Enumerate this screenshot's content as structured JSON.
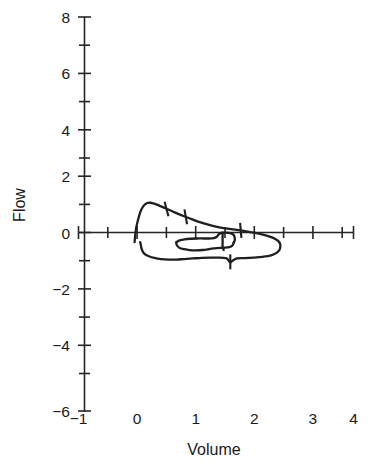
{
  "chart_data": {
    "type": "line",
    "title": "",
    "subtitle": "",
    "xlabel": "Volume",
    "ylabel": "Flow",
    "xlim": [
      -1,
      4
    ],
    "ylim": [
      -6,
      8
    ],
    "grid": false,
    "legend": null,
    "x_ticks_major": [
      -1,
      0,
      1,
      2,
      3,
      4
    ],
    "x_ticks_major_labels": [
      "−1",
      "0",
      "1",
      "2",
      "3",
      "4"
    ],
    "x_ticks_minor": [
      -0.5,
      0.5,
      1.5,
      2.5,
      3.5
    ],
    "y_ticks_major": [
      8,
      6,
      4,
      2,
      0,
      -2,
      -4,
      -6
    ],
    "y_ticks_major_labels": [
      "8",
      "6",
      "4",
      "2",
      "0",
      "−2",
      "−4",
      "−6"
    ],
    "y_ticks_minor": [
      7,
      5,
      3,
      1,
      -1,
      -3,
      -5
    ],
    "series": [
      {
        "name": "expiratory-limb",
        "comment": "rising limb from volume 0 to peak flow then falling to end of expiration",
        "points": [
          [
            0.02,
            0.0
          ],
          [
            0.03,
            0.22
          ],
          [
            0.05,
            0.52
          ],
          [
            0.09,
            0.85
          ],
          [
            0.13,
            1.1
          ],
          [
            0.18,
            1.28
          ],
          [
            0.24,
            1.38
          ],
          [
            0.31,
            1.4
          ],
          [
            0.4,
            1.35
          ],
          [
            0.5,
            1.27
          ],
          [
            0.62,
            1.17
          ],
          [
            0.76,
            1.05
          ],
          [
            0.92,
            0.92
          ],
          [
            1.08,
            0.8
          ],
          [
            1.22,
            0.7
          ],
          [
            1.36,
            0.62
          ],
          [
            1.5,
            0.55
          ],
          [
            1.64,
            0.5
          ],
          [
            1.78,
            0.46
          ],
          [
            1.95,
            0.42
          ],
          [
            2.12,
            0.36
          ],
          [
            2.28,
            0.3
          ],
          [
            2.42,
            0.23
          ],
          [
            2.54,
            0.15
          ],
          [
            2.62,
            0.06
          ],
          [
            2.65,
            0.0
          ]
        ]
      },
      {
        "name": "inspiratory-limb",
        "comment": "returns from end-expiration back to volume 0 below the zero-flow axis",
        "points": [
          [
            2.65,
            0.0
          ],
          [
            2.67,
            -0.1
          ],
          [
            2.66,
            -0.25
          ],
          [
            2.6,
            -0.38
          ],
          [
            2.5,
            -0.47
          ],
          [
            2.35,
            -0.52
          ],
          [
            2.18,
            -0.55
          ],
          [
            2.02,
            -0.57
          ],
          [
            1.88,
            -0.58
          ],
          [
            1.8,
            -0.66
          ],
          [
            1.76,
            -0.72
          ],
          [
            1.72,
            -0.63
          ],
          [
            1.68,
            -0.57
          ],
          [
            1.55,
            -0.55
          ],
          [
            1.4,
            -0.55
          ],
          [
            1.24,
            -0.56
          ],
          [
            1.08,
            -0.58
          ],
          [
            0.92,
            -0.6
          ],
          [
            0.78,
            -0.62
          ],
          [
            0.64,
            -0.62
          ],
          [
            0.5,
            -0.6
          ],
          [
            0.38,
            -0.56
          ],
          [
            0.28,
            -0.5
          ],
          [
            0.2,
            -0.42
          ],
          [
            0.16,
            -0.3
          ],
          [
            0.14,
            -0.18
          ],
          [
            0.13,
            -0.06
          ],
          [
            0.12,
            0.0
          ]
        ]
      },
      {
        "name": "tidal-loop-upper",
        "comment": "small inner tidal breathing loop, upper (expiratory) portion",
        "points": [
          [
            0.78,
            0.0
          ],
          [
            0.84,
            0.06
          ],
          [
            0.93,
            0.1
          ],
          [
            1.04,
            0.12
          ],
          [
            1.16,
            0.13
          ],
          [
            1.28,
            0.13
          ],
          [
            1.38,
            0.13
          ],
          [
            1.46,
            0.14
          ],
          [
            1.52,
            0.2
          ],
          [
            1.55,
            0.28
          ],
          [
            1.6,
            0.33
          ],
          [
            1.68,
            0.34
          ],
          [
            1.76,
            0.32
          ],
          [
            1.82,
            0.26
          ],
          [
            1.84,
            0.16
          ],
          [
            1.84,
            0.06
          ],
          [
            1.82,
            -0.02
          ]
        ]
      },
      {
        "name": "tidal-loop-lower",
        "comment": "small inner tidal breathing loop, lower (inspiratory) portion",
        "points": [
          [
            1.82,
            -0.02
          ],
          [
            1.8,
            -0.12
          ],
          [
            1.74,
            -0.18
          ],
          [
            1.64,
            -0.2
          ],
          [
            1.52,
            -0.21
          ],
          [
            1.42,
            -0.23
          ],
          [
            1.34,
            -0.26
          ],
          [
            1.26,
            -0.28
          ],
          [
            1.14,
            -0.29
          ],
          [
            1.02,
            -0.28
          ],
          [
            0.92,
            -0.25
          ],
          [
            0.84,
            -0.21
          ],
          [
            0.8,
            -0.14
          ],
          [
            0.78,
            -0.06
          ],
          [
            0.78,
            0.0
          ]
        ]
      },
      {
        "name": "tidal-loop-link",
        "comment": "short segment joining inner loop back toward the axis",
        "points": [
          [
            1.62,
            0.34
          ],
          [
            1.62,
            0.2
          ],
          [
            1.62,
            0.06
          ],
          [
            1.62,
            -0.05
          ],
          [
            1.62,
            -0.18
          ],
          [
            1.64,
            -0.28
          ]
        ]
      }
    ],
    "curve_markers": [
      {
        "name": "marker-expiratory-1",
        "x": 0.6,
        "y": 1.18,
        "angle": 105
      },
      {
        "name": "marker-expiratory-2",
        "x": 0.95,
        "y": 0.9,
        "angle": 100
      },
      {
        "name": "marker-expiratory-3",
        "x": 1.95,
        "y": 0.42,
        "angle": 95
      },
      {
        "name": "marker-inspiratory-1",
        "x": 1.76,
        "y": -0.7,
        "angle": 90
      }
    ]
  }
}
